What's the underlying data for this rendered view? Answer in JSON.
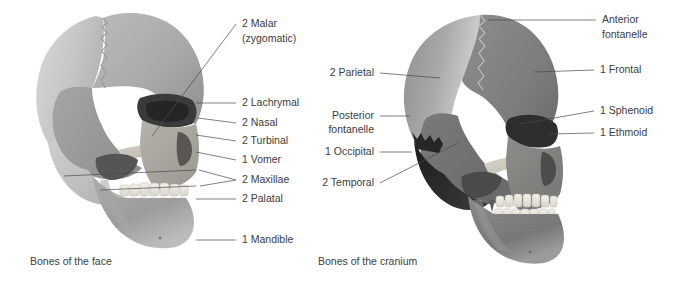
{
  "figure": {
    "background": "#ffffff",
    "text_color": "#3c3c3c",
    "leader_color": "#4a4a4a"
  },
  "panels": [
    {
      "id": "face",
      "caption": "Bones of the face",
      "labels": [
        {
          "id": "malar",
          "line1": "2 Malar",
          "line2": "(zygomatic)"
        },
        {
          "id": "lachrymal",
          "line1": "2 Lachrymal",
          "line2": ""
        },
        {
          "id": "nasal",
          "line1": "2 Nasal",
          "line2": ""
        },
        {
          "id": "turbinal",
          "line1": "2 Turbinal",
          "line2": ""
        },
        {
          "id": "vomer",
          "line1": "1 Vomer",
          "line2": ""
        },
        {
          "id": "maxillae",
          "line1": "2 Maxillae",
          "line2": ""
        },
        {
          "id": "palatal",
          "line1": "2 Palatal",
          "line2": ""
        },
        {
          "id": "mandible",
          "line1": "1 Mandible",
          "line2": ""
        }
      ]
    },
    {
      "id": "cranium",
      "caption": "Bones of the cranium",
      "labels": [
        {
          "id": "anterior-fontanelle",
          "line1": "Anterior",
          "line2": "fontanelle"
        },
        {
          "id": "frontal",
          "line1": "1 Frontal",
          "line2": ""
        },
        {
          "id": "sphenoid",
          "line1": "1 Sphenoid",
          "line2": ""
        },
        {
          "id": "ethmoid",
          "line1": "1 Ethmoid",
          "line2": ""
        },
        {
          "id": "parietal",
          "line1": "2 Parietal",
          "line2": ""
        },
        {
          "id": "posterior-fontanelle",
          "line1": "Posterior",
          "line2": "fontanelle"
        },
        {
          "id": "occipital",
          "line1": "1 Occipital",
          "line2": ""
        },
        {
          "id": "temporal",
          "line1": "2 Temporal",
          "line2": ""
        }
      ]
    }
  ]
}
